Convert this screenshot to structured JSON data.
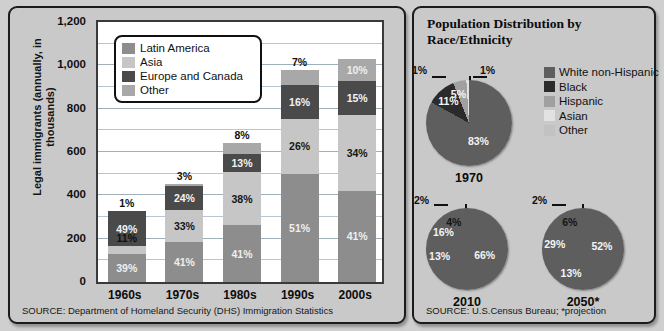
{
  "left_panel": {
    "y_axis_label": "Legal immigrants (annually, in thousands)",
    "source": "SOURCE: Department of Homeland Security (DHS) Immigration Statistics",
    "legend": [
      {
        "label": "Latin America",
        "color": "#8d8d8d"
      },
      {
        "label": "Asia",
        "color": "#c6c6c6"
      },
      {
        "label": "Europe and Canada",
        "color": "#4a4a4a"
      },
      {
        "label": "Other",
        "color": "#a8a8a8"
      }
    ]
  },
  "right_panel": {
    "title": "Population Distribution by Race/Ethnicity",
    "source": "SOURCE: U.S.Census Bureau; *projection",
    "legend": [
      {
        "label": "White non-Hispanic",
        "color": "#5e5e5e"
      },
      {
        "label": "Black",
        "color": "#2b2b2b"
      },
      {
        "label": "Hispanic",
        "color": "#a0a0a0"
      },
      {
        "label": "Asian",
        "color": "#e2e2e2"
      },
      {
        "label": "Other",
        "color": "#c2c2c2"
      }
    ]
  },
  "chart_data": [
    {
      "type": "bar",
      "title": "",
      "stacked": true,
      "xlabel": "",
      "ylabel": "Legal immigrants (annually, in thousands)",
      "ylim": [
        0,
        1200
      ],
      "yticks": [
        "0",
        "200",
        "400",
        "600",
        "800",
        "1,000",
        "1,200"
      ],
      "grid": true,
      "legend_position": "inside-top-left",
      "categories": [
        "1960s",
        "1970s",
        "1980s",
        "1990s",
        "2000s"
      ],
      "totals": [
        330,
        450,
        640,
        980,
        1030
      ],
      "unit": "thousands per year",
      "series": [
        {
          "name": "Latin America",
          "color": "#8d8d8d",
          "values": [
            39,
            41,
            41,
            51,
            41
          ],
          "labels": [
            "39%",
            "41%",
            "41%",
            "51%",
            "41%"
          ]
        },
        {
          "name": "Asia",
          "color": "#c6c6c6",
          "values": [
            11,
            33,
            38,
            26,
            34
          ],
          "labels": [
            "11%",
            "33%",
            "38%",
            "26%",
            "34%"
          ]
        },
        {
          "name": "Europe and Canada",
          "color": "#4a4a4a",
          "values": [
            49,
            24,
            13,
            16,
            15
          ],
          "labels": [
            "49%",
            "24%",
            "13%",
            "16%",
            "15%"
          ]
        },
        {
          "name": "Other",
          "color": "#a8a8a8",
          "values": [
            1,
            3,
            8,
            7,
            10
          ],
          "labels": [
            "1%",
            "3%",
            "8%",
            "7%",
            "10%"
          ]
        }
      ]
    },
    {
      "type": "pie",
      "title": "1970",
      "labels": [
        "White non-Hispanic",
        "Black",
        "Hispanic",
        "Asian",
        "Other"
      ],
      "values": [
        83,
        11,
        5,
        1,
        1
      ],
      "value_labels": [
        "83%",
        "11%",
        "5%",
        "1%",
        "1%"
      ],
      "colors": [
        "#5e5e5e",
        "#2b2b2b",
        "#a0a0a0",
        "#e2e2e2",
        "#c2c2c2"
      ]
    },
    {
      "type": "pie",
      "title": "2010",
      "labels": [
        "White non-Hispanic",
        "Black",
        "Hispanic",
        "Asian",
        "Other"
      ],
      "values": [
        66,
        13,
        16,
        4,
        2
      ],
      "value_labels": [
        "66%",
        "13%",
        "16%",
        "4%",
        "2%"
      ],
      "colors": [
        "#5e5e5e",
        "#2b2b2b",
        "#a0a0a0",
        "#e2e2e2",
        "#c2c2c2"
      ]
    },
    {
      "type": "pie",
      "title": "2050*",
      "labels": [
        "White non-Hispanic",
        "Black",
        "Hispanic",
        "Asian",
        "Other"
      ],
      "values": [
        52,
        13,
        29,
        6,
        2
      ],
      "value_labels": [
        "52%",
        "13%",
        "29%",
        "6%",
        "2%"
      ],
      "colors": [
        "#5e5e5e",
        "#2b2b2b",
        "#a0a0a0",
        "#e2e2e2",
        "#c2c2c2"
      ]
    }
  ]
}
